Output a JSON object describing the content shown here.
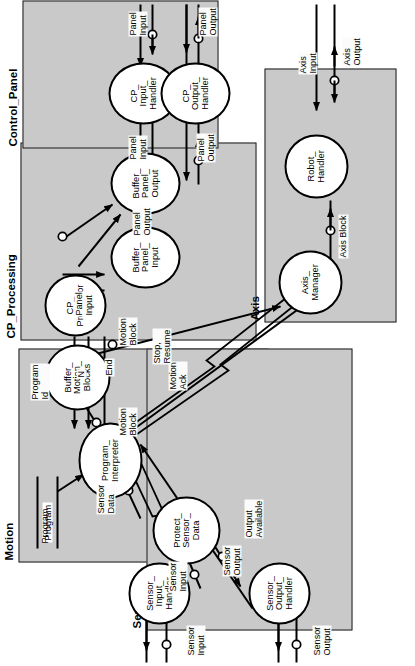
{
  "diagram": {
    "orientation": "rotated-90-ccw",
    "fill_color": "#c9c9c9",
    "line_color": "#000000"
  },
  "groups": [
    {
      "id": "motion",
      "label": "Motion"
    },
    {
      "id": "sensors",
      "label": "Sensors"
    },
    {
      "id": "cp_processing",
      "label": "CP_Processing"
    },
    {
      "id": "control_panel",
      "label": "Control_Panel"
    },
    {
      "id": "axis",
      "label": "Axis"
    }
  ],
  "processes": [
    {
      "id": "program_interpreter",
      "label": "Program_\nInterpreter",
      "group": "motion"
    },
    {
      "id": "buffer_motion_blocks",
      "label": "Buffer_\nMotion_\nBlocks",
      "group": "motion"
    },
    {
      "id": "protect_sensor_data",
      "label": "Protect_\nSensor_\nData",
      "group": "sensors"
    },
    {
      "id": "sensor_input_handler",
      "label": "Sensor_\nInput_\nHandler",
      "group": "sensors"
    },
    {
      "id": "sensor_output_handler",
      "label": "Sensor_\nOutput_\nHandler",
      "group": "sensors"
    },
    {
      "id": "cp_processor",
      "label": "CP_\nProcessor",
      "group": "cp_processing"
    },
    {
      "id": "buffer_panel_input",
      "label": "Buffer_\nPanel_\nInput",
      "group": "cp_processing"
    },
    {
      "id": "buffer_panel_output",
      "label": "Buffer_\nPanel_\nOutput",
      "group": "cp_processing"
    },
    {
      "id": "cp_input_handler",
      "label": "CP_\nInput_\nHandler",
      "group": "control_panel"
    },
    {
      "id": "cp_output_handler",
      "label": "CP_\nOutput_\nHandler",
      "group": "control_panel"
    },
    {
      "id": "axis_manager",
      "label": "Axis_\nManager",
      "group": "axis"
    },
    {
      "id": "robot_handler",
      "label": "Robot_\nHandler",
      "group": "axis"
    }
  ],
  "stores": [
    {
      "id": "program_store",
      "label": "Program",
      "group": "motion"
    }
  ],
  "flows": [
    {
      "id": "f_program",
      "label": "Program",
      "from": "program_store",
      "to": "program_interpreter"
    },
    {
      "id": "f_sensor_data",
      "label": "Sensor\nData",
      "from": "protect_sensor_data",
      "to": "program_interpreter"
    },
    {
      "id": "f_sensor_input_1",
      "label": "Sensor\nInput",
      "from": "sensor_input_handler",
      "to": "protect_sensor_data"
    },
    {
      "id": "f_sensor_output_1",
      "label": "Sensor\nOutput",
      "from": "protect_sensor_data",
      "to": "sensor_output_handler"
    },
    {
      "id": "f_output_available",
      "label": "Output\nAvailable",
      "from": "sensor_output_handler",
      "to": "program_interpreter"
    },
    {
      "id": "f_sensor_input_ext",
      "label": "Sensor\nInput",
      "from": "external",
      "to": "sensor_input_handler"
    },
    {
      "id": "f_sensor_output_ext",
      "label": "Sensor\nOutput",
      "from": "sensor_output_handler",
      "to": "external"
    },
    {
      "id": "f_motion_block_1",
      "label": "Motion\nBlock",
      "from": "program_interpreter",
      "to": "buffer_motion_blocks"
    },
    {
      "id": "f_motion_block_2",
      "label": "Motion\nBlock",
      "from": "buffer_motion_blocks",
      "to": "axis_manager"
    },
    {
      "id": "f_motion_ack",
      "label": "Motion\nAck",
      "from": "axis_manager",
      "to": "program_interpreter"
    },
    {
      "id": "f_stop_resume",
      "label": "Stop,\nResume",
      "from": "cp_processor",
      "to": "program_interpreter"
    },
    {
      "id": "f_program_id",
      "label": "Program\nId",
      "from": "cp_processor",
      "to": "program_interpreter"
    },
    {
      "id": "f_n",
      "label": "N",
      "from": "cp_processor",
      "to": "program_interpreter"
    },
    {
      "id": "f_end",
      "label": "End",
      "from": "program_interpreter",
      "to": "cp_processor"
    },
    {
      "id": "f_panel_input_1",
      "label": "Panel\nInput",
      "from": "buffer_panel_input",
      "to": "cp_processor"
    },
    {
      "id": "f_panel_output_1",
      "label": "Panel\nOutput",
      "from": "cp_processor",
      "to": "buffer_panel_output"
    },
    {
      "id": "f_panel_input_2",
      "label": "Panel\nInput",
      "from": "cp_input_handler",
      "to": "buffer_panel_input"
    },
    {
      "id": "f_panel_output_2",
      "label": "Panel\nOutput",
      "from": "buffer_panel_output",
      "to": "cp_output_handler"
    },
    {
      "id": "f_panel_input_ext",
      "label": "Panel\nInput",
      "from": "external",
      "to": "cp_input_handler"
    },
    {
      "id": "f_panel_output_ext",
      "label": "Panel\nOutput",
      "from": "cp_output_handler",
      "to": "external"
    },
    {
      "id": "f_axis_block",
      "label": "Axis Block",
      "from": "axis_manager",
      "to": "robot_handler"
    },
    {
      "id": "f_axis_input_ext",
      "label": "Axis\nInput",
      "from": "external",
      "to": "robot_handler"
    },
    {
      "id": "f_axis_output_ext",
      "label": "Axis\nOutput",
      "from": "robot_handler",
      "to": "external"
    }
  ]
}
